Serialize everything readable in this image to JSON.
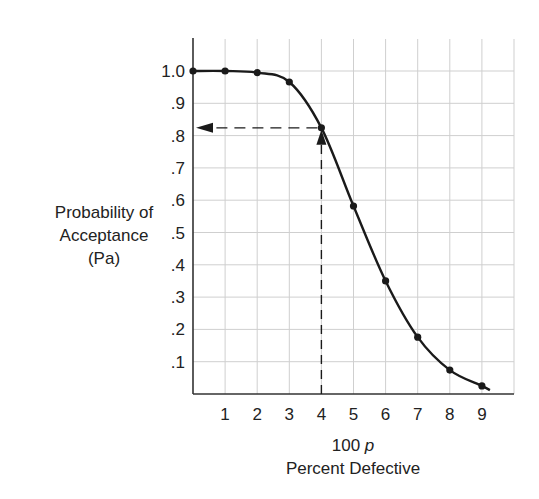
{
  "chart_data": {
    "type": "line",
    "title": "",
    "xlabel": "100 p",
    "xlabel_sub": "Percent Defective",
    "ylabel": [
      "Probability of",
      "Acceptance",
      "(Pa)"
    ],
    "x": [
      0,
      1,
      2,
      3,
      4,
      5,
      6,
      7,
      8,
      9
    ],
    "values": [
      1.0,
      1.0,
      0.995,
      0.966,
      0.824,
      0.582,
      0.35,
      0.176,
      0.074,
      0.025
    ],
    "xlim": [
      0,
      10
    ],
    "ylim": [
      0,
      1.1
    ],
    "x_tick_labels": [
      "1",
      "2",
      "3",
      "4",
      "5",
      "6",
      "7",
      "8",
      "9"
    ],
    "y_tick_labels": [
      ".1",
      ".2",
      ".3",
      ".4",
      ".5",
      ".6",
      ".7",
      ".8",
      ".9",
      "1.0"
    ],
    "grid": true,
    "annotations": [
      {
        "type": "dashed-vertical-arrow",
        "x": 4,
        "from_y": 0,
        "to_y": 0.824
      },
      {
        "type": "dashed-horizontal-arrow",
        "y": 0.824,
        "from_x": 4,
        "to_x": 0
      }
    ],
    "legend": null
  },
  "colors": {
    "line": "#1a1a1a",
    "grid": "#cfcfcf",
    "axis": "#333333"
  }
}
